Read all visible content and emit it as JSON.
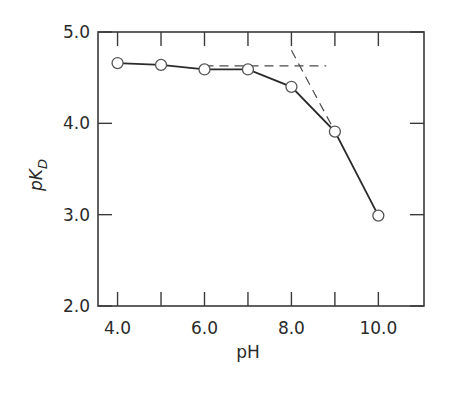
{
  "chart_data": {
    "type": "line",
    "title": "",
    "xlabel": "pH",
    "ylabel": "pK_D",
    "ylabel_main": "pK",
    "ylabel_sub": "D",
    "xlim": [
      3.55,
      11.05
    ],
    "ylim": [
      2.0,
      5.0
    ],
    "x_ticks": [
      4.0,
      5.0,
      6.0,
      7.0,
      8.0,
      9.0,
      10.0
    ],
    "x_tick_labels": [
      "4.0",
      "6.0",
      "8.0",
      "10.0"
    ],
    "x_tick_label_values": [
      4.0,
      6.0,
      8.0,
      10.0
    ],
    "y_ticks": [
      2.0,
      3.0,
      4.0,
      5.0
    ],
    "y_tick_labels": [
      "2.0",
      "3.0",
      "4.0",
      "5.0"
    ],
    "grid": false,
    "legend": null,
    "series": [
      {
        "name": "pK_D",
        "marker": "open-circle",
        "line": "solid",
        "x": [
          4.0,
          5.0,
          6.0,
          7.0,
          8.0,
          9.0,
          10.0
        ],
        "y": [
          4.66,
          4.64,
          4.59,
          4.59,
          4.4,
          3.91,
          2.99
        ]
      }
    ],
    "annotations": [
      {
        "type": "dashed-line",
        "description": "horizontal asymptote",
        "x": [
          6.0,
          8.8
        ],
        "y": [
          4.63,
          4.63
        ]
      },
      {
        "type": "dashed-line",
        "description": "high-pH slope extrapolation",
        "x": [
          8.0,
          9.0
        ],
        "y": [
          4.8,
          3.91
        ]
      }
    ]
  }
}
